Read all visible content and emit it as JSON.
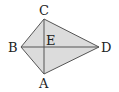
{
  "diagram": {
    "type": "kite",
    "fill_color": "#dcdcdc",
    "stroke_color": "#555555",
    "vertices": {
      "A": {
        "label": "A",
        "x": 44,
        "y": 74
      },
      "B": {
        "label": "B",
        "x": 21,
        "y": 47
      },
      "C": {
        "label": "C",
        "x": 44,
        "y": 19
      },
      "D": {
        "label": "D",
        "x": 99,
        "y": 47
      }
    },
    "intersection": {
      "label": "E",
      "x": 44,
      "y": 47
    },
    "diagonals": [
      [
        "A",
        "C"
      ],
      [
        "B",
        "D"
      ]
    ]
  }
}
